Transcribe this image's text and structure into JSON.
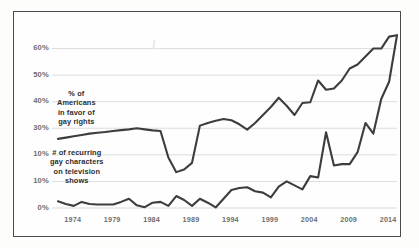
{
  "figure": {
    "background_color": "#fdfdfc",
    "frame_color": "#4a4a4a",
    "gridline_color": "#d9d9d9",
    "line_color": "#3d3d3d",
    "tick_label_color": "#6d6d6d",
    "annotation_color": "#2e2e2e"
  },
  "chart_data": {
    "type": "line",
    "title": "",
    "subtitle": "",
    "xlabel": "",
    "ylabel": "",
    "xlim": [
      1972,
      2015
    ],
    "ylim": [
      0,
      70
    ],
    "grid": true,
    "grid_axis": "y",
    "legend_position": "inline-annotation",
    "x_tick_labels": [
      "1974",
      "1979",
      "1984",
      "1989",
      "1994",
      "1999",
      "2004",
      "2009",
      "2014"
    ],
    "x_tick_values": [
      1974,
      1979,
      1984,
      1989,
      1994,
      1999,
      2004,
      2009,
      2014
    ],
    "y_tick_labels": [
      "60%",
      "50%",
      "40%",
      "30%",
      "10%",
      "10%",
      "0%"
    ],
    "y_tick_values": [
      60,
      50,
      40,
      30,
      20,
      10,
      0
    ],
    "annotations": [
      {
        "name": "series-label-public-opinion",
        "lines": [
          "% of",
          "Americans",
          "in favor of",
          "gay rights"
        ],
        "target_series": "% of Americans in favor of gay rights"
      },
      {
        "name": "series-label-tv-characters",
        "lines": [
          "# of recurring",
          "gay characters",
          "on television",
          "shows"
        ],
        "target_series": "# of recurring gay characters on television shows"
      }
    ],
    "series": [
      {
        "name": "% of Americans in favor of gay rights",
        "x": [
          1972,
          1973,
          1974,
          1975,
          1976,
          1977,
          1978,
          1979,
          1980,
          1981,
          1982,
          1983,
          1984,
          1985,
          1986,
          1987,
          1988,
          1989,
          1990,
          1991,
          1992,
          1993,
          1994,
          1995,
          1996,
          1997,
          1998,
          1999,
          2000,
          2001,
          2002,
          2003,
          2004,
          2005,
          2006,
          2007,
          2008,
          2009,
          2010,
          2011,
          2012,
          2013,
          2014,
          2015
        ],
        "values": [
          26,
          26.5,
          27,
          27.5,
          28,
          28.3,
          28.6,
          29,
          29.3,
          29.6,
          30,
          29.6,
          29.2,
          29,
          19,
          13.5,
          14.5,
          17,
          31,
          32,
          32.8,
          33.5,
          33,
          31.5,
          29.5,
          32,
          35,
          38,
          41.5,
          38.5,
          35,
          39.5,
          39.8,
          48,
          44.5,
          45,
          48,
          52.5,
          54,
          57,
          60,
          60,
          64.5,
          65
        ]
      },
      {
        "name": "# of recurring gay characters on television shows",
        "x": [
          1972,
          1973,
          1974,
          1975,
          1976,
          1977,
          1978,
          1979,
          1980,
          1981,
          1982,
          1983,
          1984,
          1985,
          1986,
          1987,
          1988,
          1989,
          1990,
          1991,
          1992,
          1993,
          1994,
          1995,
          1996,
          1997,
          1998,
          1999,
          2000,
          2001,
          2002,
          2003,
          2004,
          2005,
          2006,
          2007,
          2008,
          2009,
          2010,
          2011,
          2012,
          2013,
          2014,
          2015
        ],
        "values": [
          2.5,
          1.5,
          0.8,
          2.3,
          1.5,
          1.3,
          1.3,
          1.3,
          2.3,
          3.5,
          1.0,
          0.3,
          2.0,
          2.3,
          0.8,
          4.5,
          3.0,
          0.8,
          3.5,
          2.0,
          0.2,
          3.5,
          6.8,
          7.5,
          7.8,
          6.3,
          5.8,
          4.0,
          8.0,
          10.0,
          8.5,
          7.0,
          12.0,
          11.5,
          28.5,
          16.0,
          16.5,
          16.5,
          21.0,
          32.0,
          28.0,
          41.0,
          47.5,
          65
        ]
      }
    ]
  }
}
